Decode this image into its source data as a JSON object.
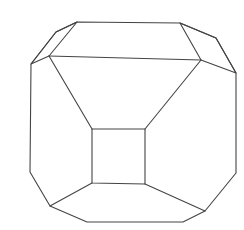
{
  "diagram": {
    "type": "polyhedron-line-drawing",
    "stroke_color": "#444444",
    "background": "#ffffff",
    "faces": [
      {
        "name": "outer-outline",
        "points": [
          [
            77,
            22
          ],
          [
            180,
            23
          ],
          [
            216,
            38
          ],
          [
            236,
            73
          ],
          [
            236,
            173
          ],
          [
            205,
            211
          ],
          [
            183,
            222
          ],
          [
            87,
            222
          ],
          [
            50,
            206
          ],
          [
            30,
            172
          ],
          [
            31,
            64
          ],
          [
            56,
            32
          ]
        ]
      },
      {
        "name": "top-left-corner-face",
        "points": [
          [
            77,
            22
          ],
          [
            56,
            32
          ],
          [
            31,
            64
          ],
          [
            49,
            56
          ]
        ]
      },
      {
        "name": "top-right-corner-face",
        "points": [
          [
            180,
            23
          ],
          [
            216,
            38
          ],
          [
            236,
            73
          ],
          [
            201,
            60
          ]
        ]
      },
      {
        "name": "front-square-face",
        "points": [
          [
            92,
            129
          ],
          [
            145,
            129
          ],
          [
            145,
            184
          ],
          [
            92,
            183
          ]
        ]
      }
    ],
    "edges": [
      {
        "name": "top-edge-inner",
        "from": [
          49,
          56
        ],
        "to": [
          201,
          60
        ]
      },
      {
        "name": "edge-tl-to-square",
        "from": [
          49,
          56
        ],
        "to": [
          92,
          129
        ]
      },
      {
        "name": "edge-tr-to-square",
        "from": [
          201,
          60
        ],
        "to": [
          145,
          129
        ]
      },
      {
        "name": "edge-square-to-bl",
        "from": [
          92,
          183
        ],
        "to": [
          50,
          206
        ]
      },
      {
        "name": "edge-square-to-br",
        "from": [
          145,
          184
        ],
        "to": [
          205,
          211
        ]
      }
    ]
  }
}
